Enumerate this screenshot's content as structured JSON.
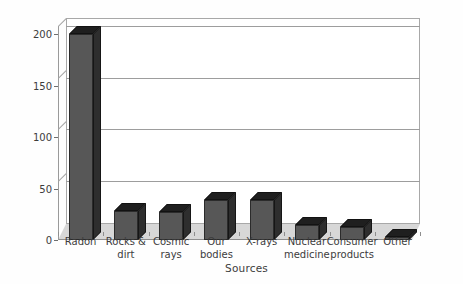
{
  "chart_data": {
    "type": "bar",
    "title": "",
    "xlabel": "Sources",
    "ylabel": "Dose ( mrem/a )",
    "categories": [
      "Radon",
      "Rocks & dirt",
      "Cosmic rays",
      "Our bodies",
      "X-rays",
      "Nuclear medicine",
      "Consumer products",
      "Other"
    ],
    "values": [
      200,
      28,
      27,
      39,
      39,
      15,
      13,
      3
    ],
    "ylim": [
      0,
      210
    ],
    "yticks": [
      0,
      50,
      100,
      150,
      200
    ],
    "ytick_labels": [
      "0",
      "50",
      "100",
      "150",
      "200"
    ],
    "grid": "horizontal",
    "legend": "none",
    "style": "3d-column",
    "colors": {
      "bar_front": "#575757",
      "bar_top": "#1f1f1f",
      "bar_side": "#2e2e2e",
      "floor": "#d7d7d7",
      "gridline": "#9d9d9d",
      "plot_border": "#a8a8a8",
      "text": "#3c3c3c",
      "background": "#ffffff"
    }
  },
  "axes": {
    "y_title": "Dose ( mrem/a )",
    "x_title": "Sources"
  }
}
